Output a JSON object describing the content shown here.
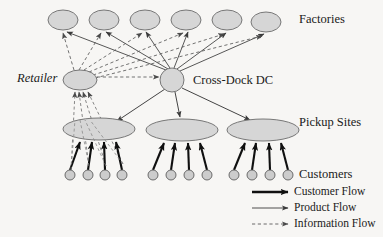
{
  "diagram": {
    "background_color": "#f7f6f4",
    "node_fill": "#d6d6d6",
    "node_stroke": "#6b6b6b",
    "line_color": "#3a3a3a"
  },
  "labels": {
    "factories": "Factories",
    "retailer": "Retailer",
    "cross_dock": "Cross-Dock DC",
    "pickup_sites": "Pickup Sites",
    "customers": "Customers"
  },
  "legend": {
    "items": [
      {
        "label": "Customer Flow",
        "style": "thick-solid",
        "color": "#1a1a1a"
      },
      {
        "label": "Product Flow",
        "style": "thin-solid",
        "color": "#1a1a1a"
      },
      {
        "label": "Information Flow",
        "style": "dashed",
        "color": "#4a4a4a"
      }
    ]
  },
  "nodes": {
    "factories": [
      {
        "cx": 63,
        "cy": 20,
        "rx": 15,
        "ry": 10
      },
      {
        "cx": 104,
        "cy": 20,
        "rx": 15,
        "ry": 10
      },
      {
        "cx": 145,
        "cy": 20,
        "rx": 15,
        "ry": 10
      },
      {
        "cx": 186,
        "cy": 20,
        "rx": 15,
        "ry": 10
      },
      {
        "cx": 227,
        "cy": 20,
        "rx": 15,
        "ry": 10
      },
      {
        "cx": 266,
        "cy": 22,
        "rx": 15,
        "ry": 10
      }
    ],
    "retailer": {
      "cx": 80,
      "cy": 80,
      "rx": 17,
      "ry": 10
    },
    "cross_dock": {
      "cx": 172,
      "cy": 80,
      "r": 12
    },
    "pickup_sites": [
      {
        "cx": 99,
        "cy": 129,
        "rx": 36,
        "ry": 11
      },
      {
        "cx": 182,
        "cy": 130,
        "rx": 36,
        "ry": 11
      },
      {
        "cx": 263,
        "cy": 130,
        "rx": 36,
        "ry": 11
      }
    ],
    "customers": [
      {
        "cx": 70,
        "cy": 175,
        "r": 5
      },
      {
        "cx": 88,
        "cy": 175,
        "r": 5
      },
      {
        "cx": 105,
        "cy": 175,
        "r": 5
      },
      {
        "cx": 122,
        "cy": 175,
        "r": 5
      },
      {
        "cx": 153,
        "cy": 175,
        "r": 5
      },
      {
        "cx": 171,
        "cy": 175,
        "r": 5
      },
      {
        "cx": 189,
        "cy": 175,
        "r": 5
      },
      {
        "cx": 207,
        "cy": 175,
        "r": 5
      },
      {
        "cx": 234,
        "cy": 175,
        "r": 5
      },
      {
        "cx": 252,
        "cy": 175,
        "r": 5
      },
      {
        "cx": 270,
        "cy": 175,
        "r": 5
      },
      {
        "cx": 288,
        "cy": 175,
        "r": 5
      }
    ]
  }
}
